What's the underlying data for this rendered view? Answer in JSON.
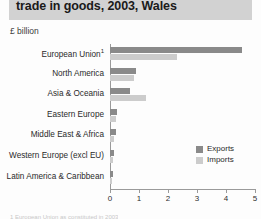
{
  "header": {
    "title": "trade in goods, 2003, Wales",
    "band_color": "#d2d2d2"
  },
  "units_label": "£ billion",
  "footnote": "1 European Union as constituted in 2003",
  "legend": {
    "items": [
      {
        "label": "Exports",
        "color": "#8a8a8a"
      },
      {
        "label": "Imports",
        "color": "#cccccc"
      }
    ]
  },
  "axis": {
    "ticks": [
      "0",
      "1",
      "2",
      "3",
      "4",
      "5"
    ]
  },
  "chart_data": {
    "type": "bar",
    "orientation": "horizontal",
    "title": "trade in goods, 2003, Wales",
    "subtitle": "",
    "xlabel": "£ billion",
    "ylabel": "",
    "xlim": [
      0,
      5
    ],
    "xticks": [
      0,
      1,
      2,
      3,
      4,
      5
    ],
    "grid": false,
    "legend_position": "right-middle",
    "categories": [
      "European Union¹",
      "North America",
      "Asia & Oceania",
      "Eastern Europe",
      "Middle East & Africa",
      "Western Europe (excl EU)",
      "Latin America & Caribbean"
    ],
    "series": [
      {
        "name": "Exports",
        "color": "#8a8a8a",
        "values": [
          4.55,
          0.88,
          0.7,
          0.25,
          0.22,
          0.13,
          0.1
        ]
      },
      {
        "name": "Imports",
        "color": "#cccccc",
        "values": [
          2.3,
          0.84,
          1.25,
          0.2,
          0.15,
          0.1,
          0.07
        ]
      }
    ]
  }
}
